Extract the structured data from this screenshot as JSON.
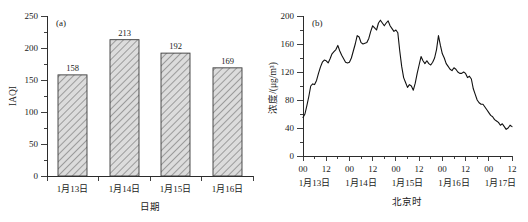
{
  "figure": {
    "background": "#ffffff",
    "width": 528,
    "height": 222
  },
  "chart_data": [
    {
      "type": "bar",
      "panel_label": "(a)",
      "title": "",
      "categories": [
        "1月13日",
        "1月14日",
        "1月15日",
        "1月16日"
      ],
      "values": [
        158,
        213,
        192,
        169
      ],
      "data_labels": [
        "158",
        "213",
        "192",
        "169"
      ],
      "xlabel": "日期",
      "ylabel": "IAQI",
      "ylim": [
        0,
        250
      ],
      "yticks": [
        0,
        50,
        100,
        150,
        200,
        250
      ],
      "ytick_labels": [
        "0",
        "50",
        "100",
        "150",
        "200",
        "250"
      ],
      "grid": false,
      "legend": "none",
      "bar_fill": "#d8d8d8",
      "bar_edge": "#3a3a3a",
      "bar_hatch": "diagonal"
    },
    {
      "type": "line",
      "panel_label": "(b)",
      "title": "",
      "xlabel": "北京时",
      "ylabel": "浓度/(μg/m³)",
      "ylim": [
        0,
        200
      ],
      "yticks": [
        0,
        40,
        80,
        120,
        160,
        200
      ],
      "ytick_labels": [
        "0",
        "40",
        "80",
        "120",
        "160",
        "200"
      ],
      "xlim": [
        0,
        108
      ],
      "xticks": [
        0,
        12,
        24,
        36,
        48,
        60,
        72,
        84,
        96,
        108
      ],
      "xtick_labels": [
        "00",
        "12",
        "00",
        "12",
        "00",
        "12",
        "00",
        "12",
        "00",
        "12"
      ],
      "xday_labels": [
        "1月13日",
        "1月14日",
        "1月15日",
        "1月16日",
        "1月17日"
      ],
      "xday_positions": [
        6,
        30,
        54,
        78,
        102
      ],
      "grid": false,
      "legend": "none",
      "line_color": "#111111",
      "x": [
        0,
        1,
        2,
        3,
        4,
        5,
        6,
        7,
        8,
        9,
        10,
        11,
        12,
        13,
        14,
        15,
        16,
        17,
        18,
        19,
        20,
        21,
        22,
        23,
        24,
        25,
        26,
        27,
        28,
        29,
        30,
        31,
        32,
        33,
        34,
        35,
        36,
        37,
        38,
        39,
        40,
        41,
        42,
        43,
        44,
        45,
        46,
        47,
        48,
        49,
        50,
        51,
        52,
        53,
        54,
        55,
        56,
        57,
        58,
        59,
        60,
        61,
        62,
        63,
        64,
        65,
        66,
        67,
        68,
        69,
        70,
        71,
        72,
        73,
        74,
        75,
        76,
        77,
        78,
        79,
        80,
        81,
        82,
        83,
        84,
        85,
        86,
        87,
        88,
        89,
        90,
        91,
        92,
        93,
        94,
        95,
        96,
        97,
        98,
        99,
        100,
        101,
        102,
        103,
        104,
        105,
        106,
        107,
        108
      ],
      "values": [
        55,
        60,
        72,
        85,
        100,
        103,
        102,
        108,
        118,
        127,
        134,
        137,
        136,
        133,
        139,
        146,
        149,
        152,
        158,
        150,
        144,
        139,
        134,
        133,
        134,
        140,
        150,
        160,
        172,
        170,
        162,
        160,
        161,
        162,
        168,
        178,
        186,
        183,
        180,
        190,
        194,
        190,
        186,
        190,
        193,
        186,
        182,
        178,
        180,
        176,
        150,
        128,
        112,
        105,
        98,
        102,
        100,
        94,
        104,
        118,
        130,
        142,
        136,
        132,
        136,
        132,
        130,
        134,
        140,
        152,
        172,
        158,
        146,
        140,
        132,
        128,
        124,
        122,
        126,
        124,
        120,
        118,
        118,
        120,
        118,
        112,
        114,
        110,
        96,
        88,
        80,
        76,
        74,
        74,
        70,
        66,
        62,
        58,
        56,
        52,
        50,
        48,
        44,
        46,
        42,
        38,
        40,
        44,
        42
      ]
    }
  ]
}
